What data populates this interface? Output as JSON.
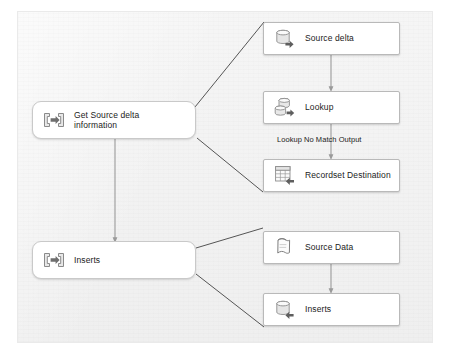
{
  "diagram": {
    "canvas_background": "#f3f3f3",
    "precedence_arrow_color": "#9a9a9a",
    "data_flow_arrow_color": "#8e8e8e",
    "connector_line_color": "#4a4a4a"
  },
  "nodes": [
    {
      "id": "get-source-delta-information",
      "label": "Get Source delta\ninformation",
      "icon": "data-flow-task-icon",
      "kind": "task"
    },
    {
      "id": "inserts-task",
      "label": "Inserts",
      "icon": "data-flow-task-icon",
      "kind": "task"
    },
    {
      "id": "source-delta",
      "label": "Source delta",
      "icon": "ole-db-source-icon",
      "kind": "component"
    },
    {
      "id": "lookup",
      "label": "Lookup",
      "icon": "lookup-transformation-icon",
      "kind": "component"
    },
    {
      "id": "recordset-destination",
      "label": "Recordset Destination",
      "icon": "recordset-destination-icon",
      "kind": "component"
    },
    {
      "id": "source-data",
      "label": "Source Data",
      "icon": "flat-file-source-icon",
      "kind": "component"
    },
    {
      "id": "inserts-destination",
      "label": "Inserts",
      "icon": "ole-db-destination-icon",
      "kind": "component"
    }
  ],
  "edges": [
    {
      "id": "source-delta-to-lookup",
      "from": "source-delta",
      "to": "lookup",
      "label": ""
    },
    {
      "id": "lookup-to-recordset-destination",
      "from": "lookup",
      "to": "recordset-destination",
      "label": "Lookup No Match Output"
    },
    {
      "id": "get-source-delta-to-inserts",
      "from": "get-source-delta-information",
      "to": "inserts-task",
      "label": ""
    },
    {
      "id": "source-data-to-inserts-destination",
      "from": "source-data",
      "to": "inserts-destination",
      "label": ""
    }
  ],
  "callouts": [
    {
      "id": "callout-delta-top",
      "from": "get-source-delta-information",
      "to": "source-delta"
    },
    {
      "id": "callout-delta-bottom",
      "from": "get-source-delta-information",
      "to": "recordset-destination"
    },
    {
      "id": "callout-inserts-top",
      "from": "inserts-task",
      "to": "source-data"
    },
    {
      "id": "callout-inserts-bottom",
      "from": "inserts-task",
      "to": "inserts-destination"
    }
  ]
}
